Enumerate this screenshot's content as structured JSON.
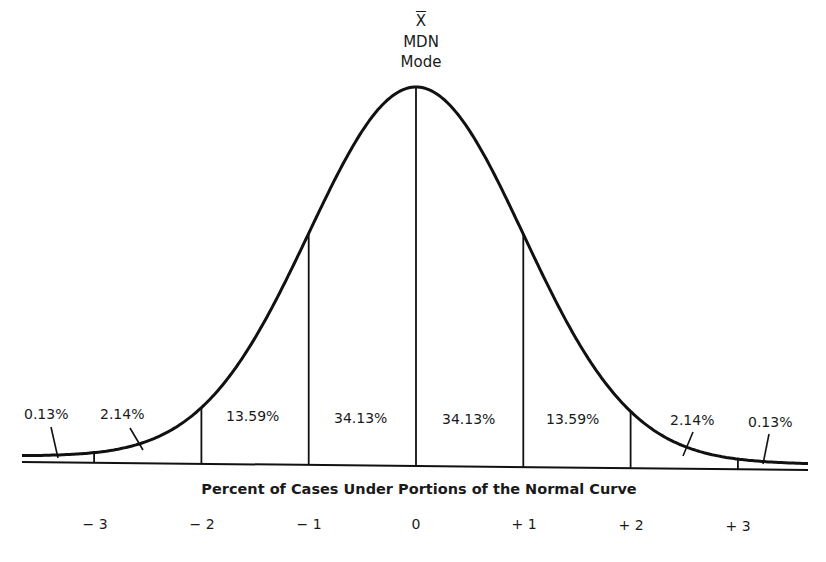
{
  "chart_data": {
    "type": "area",
    "title": "Percent of Cases Under Portions of the Normal Curve",
    "xlabel": "Percent of Cases Under Portions of the Normal Curve",
    "ylabel": "",
    "peak_labels": [
      "X̄",
      "MDN",
      "Mode"
    ],
    "x_ticks": [
      "−3",
      "−2",
      "−1",
      "0",
      "+1",
      "+2",
      "+3"
    ],
    "x_tick_values": [
      -3,
      -2,
      -1,
      0,
      1,
      2,
      3
    ],
    "xlim": [
      -3.7,
      3.7
    ],
    "grid": false,
    "legend": "none",
    "segments": [
      {
        "range": "< -3",
        "label": "0.13%",
        "value": 0.13
      },
      {
        "range": "-3 to -2",
        "label": "2.14%",
        "value": 2.14
      },
      {
        "range": "-2 to -1",
        "label": "13.59%",
        "value": 13.59
      },
      {
        "range": "-1 to 0",
        "label": "34.13%",
        "value": 34.13
      },
      {
        "range": "0 to +1",
        "label": "34.13%",
        "value": 34.13
      },
      {
        "range": "+1 to +2",
        "label": "13.59%",
        "value": 13.59
      },
      {
        "range": "+2 to +3",
        "label": "2.14%",
        "value": 2.14
      },
      {
        "range": "> +3",
        "label": "0.13%",
        "value": 0.13
      }
    ]
  },
  "labels": {
    "peak": {
      "mean": "X",
      "median": "MDN",
      "mode": "Mode"
    },
    "caption": "Percent of Cases Under Portions of the Normal Curve",
    "ticks": [
      "− 3",
      "− 2",
      "− 1",
      "0",
      "+ 1",
      "+ 2",
      "+ 3"
    ],
    "percents": [
      "0.13%",
      "2.14%",
      "13.59%",
      "34.13%",
      "34.13%",
      "13.59%",
      "2.14%",
      "0.13%"
    ]
  },
  "colors": {
    "ink": "#111111",
    "background": "#ffffff"
  }
}
